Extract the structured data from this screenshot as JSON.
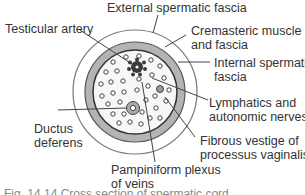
{
  "diagram": {
    "labels": {
      "external_spermatic_fascia": "External spermatic fascia",
      "testicular_artery": "Testicular artery",
      "cremasteric_line1": "Cremasteric muscle",
      "cremasteric_line2": "and fascia",
      "internal_line1": "Internal spermatic",
      "internal_line2": "fascia",
      "lymph_line1": "Lymphatics and",
      "lymph_line2": "autonomic nerves",
      "ductus_line1": "Ductus",
      "ductus_line2": "deferens",
      "fibrous_line1": "Fibrous vestige of",
      "fibrous_line2": "processus vaginalis",
      "pampiniform_line1": "Pampiniform plexus",
      "pampiniform_line2": "of veins"
    },
    "caption": "Fig. 14.14  Cross section of spermatic cord",
    "colors": {
      "band": "#b4b4b4",
      "artery": "#3a3a3a",
      "line": "#444444"
    }
  }
}
